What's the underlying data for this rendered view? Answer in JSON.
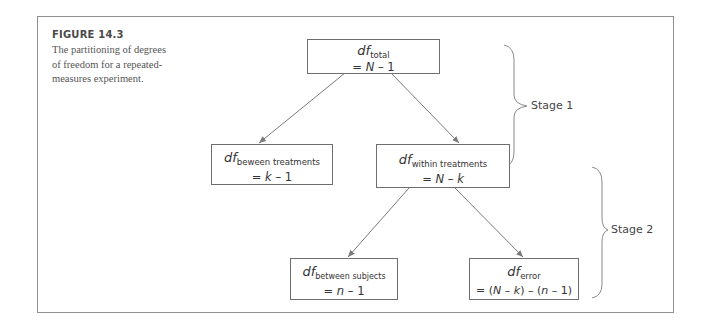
{
  "figure": {
    "label": "FIGURE 14.3",
    "caption": "The partitioning of degrees of freedom for a repeated-measures experiment.",
    "caption_lines": [
      "The partitioning of degrees",
      "of freedom for a repeated-",
      "measures experiment."
    ]
  },
  "diagram": {
    "nodes": [
      {
        "id": "total",
        "symbol": "df",
        "subscript": "total",
        "formula_prefix": "= ",
        "formula_italic": "N",
        "formula_suffix": " – 1",
        "formula": "= N – 1"
      },
      {
        "id": "between_treatments",
        "symbol": "df",
        "subscript": "beween treatments",
        "formula_prefix": "= ",
        "formula_italic": "k",
        "formula_suffix": " – 1",
        "formula": "= k – 1"
      },
      {
        "id": "within_treatments",
        "symbol": "df",
        "subscript": "within treatments",
        "formula_prefix": "= ",
        "formula_italic": "N",
        "formula_suffix": " – ",
        "formula_italic2": "k",
        "formula": "= N – k"
      },
      {
        "id": "between_subjects",
        "symbol": "df",
        "subscript": "between subjects",
        "formula_prefix": "= ",
        "formula_italic": "n",
        "formula_suffix": " – 1",
        "formula": "= n – 1"
      },
      {
        "id": "error",
        "symbol": "df",
        "subscript": "error",
        "formula": "= (N – k) – (n – 1)",
        "formula_parts": [
          "= (",
          "N",
          " – ",
          "k",
          ") – (",
          "n",
          " – 1)"
        ]
      }
    ],
    "edges": [
      {
        "from": "total",
        "to": "between_treatments"
      },
      {
        "from": "total",
        "to": "within_treatments"
      },
      {
        "from": "within_treatments",
        "to": "between_subjects"
      },
      {
        "from": "within_treatments",
        "to": "error"
      }
    ],
    "stages": [
      {
        "label": "Stage 1",
        "spans": [
          "total",
          "between_treatments",
          "within_treatments"
        ]
      },
      {
        "label": "Stage 2",
        "spans": [
          "within_treatments",
          "between_subjects",
          "error"
        ]
      }
    ]
  },
  "colors": {
    "frame_border": "#8f8f8f",
    "box_border": "#6e6e6e",
    "arrow": "#7a7a7a",
    "text": "#333333"
  }
}
